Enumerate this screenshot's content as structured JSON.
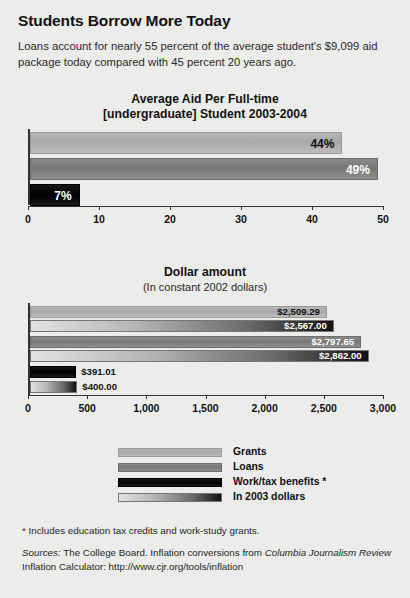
{
  "headline": "Students Borrow More Today",
  "deck": "Loans account for nearly 55 percent of the average student's $9,099 aid package today compared with 45 percent 20 years ago.",
  "chart_data": [
    {
      "type": "bar",
      "orientation": "horizontal",
      "title": "Average Aid Per Full-time\n[undergraduate] Student 2003-2004",
      "title_line1": "Average Aid Per Full-time",
      "title_line2": "[undergraduate] Student 2003-2004",
      "subtitle": "",
      "xlabel": "",
      "ylabel": "",
      "xlim": [
        0,
        50
      ],
      "ticks": [
        0,
        10,
        20,
        30,
        40,
        50
      ],
      "ticklabels": [
        "0",
        "10",
        "20",
        "30",
        "40",
        "50"
      ],
      "grid": false,
      "categories": [
        "Grants",
        "Loans",
        "Work/tax benefits *"
      ],
      "values": [
        44,
        49,
        7
      ],
      "data_labels": [
        "44%",
        "49%",
        "7%"
      ],
      "label_colors": [
        "#111111",
        "#ffffff",
        "#ffffff"
      ],
      "series_styles": [
        "grants",
        "loans",
        "work"
      ]
    },
    {
      "type": "bar",
      "orientation": "horizontal",
      "title": "Dollar amount",
      "subtitle": "(In constant 2002 dollars)",
      "xlabel": "",
      "ylabel": "",
      "xlim": [
        0,
        3000
      ],
      "ticks": [
        0,
        500,
        1000,
        1500,
        2000,
        2500,
        3000
      ],
      "ticklabels": [
        "0",
        "500",
        "1,000",
        "1,500",
        "2,000",
        "2,500",
        "3,000"
      ],
      "grid": false,
      "categories": [
        "Grants",
        "In 2003 dollars",
        "Loans",
        "In 2003 dollars",
        "Work/tax benefits *",
        "In 2003 dollars"
      ],
      "values": [
        2509.29,
        2567.0,
        2797.65,
        2862.0,
        391.01,
        400.0
      ],
      "data_labels": [
        "$2,509.29",
        "$2,567.00",
        "$2,797.65",
        "$2,862.00",
        "$391.01",
        "$400.00"
      ],
      "label_colors": [
        "#111111",
        "#ffffff",
        "#ffffff",
        "#ffffff",
        "#111111",
        "#111111"
      ],
      "label_inside": [
        true,
        true,
        true,
        true,
        false,
        false
      ],
      "series_styles": [
        "grants",
        "2003",
        "loans",
        "2003",
        "work",
        "2003"
      ]
    }
  ],
  "legend": {
    "items": [
      {
        "label": "Grants",
        "style": "grants"
      },
      {
        "label": "Loans",
        "style": "loans"
      },
      {
        "label": "Work/tax benefits *",
        "style": "work"
      },
      {
        "label": "In 2003 dollars",
        "style": "2003"
      }
    ]
  },
  "footnotes": {
    "asterisk": "* Includes education tax credits and work-study grants.",
    "sources_label": "Sources:",
    "sources_part1": " The College Board. Inflation conversions from ",
    "sources_em1": "Columbia Journalism",
    "sources_em2": "Review",
    "sources_part2": " Inflation Calculator: http://www.cjr.org/tools/inflation"
  },
  "colors": {
    "background": "#ececea",
    "axis": "#333333",
    "grants": "#aeaeae",
    "loans": "#7f7f7f",
    "work": "#000000",
    "dollars2003_start": "#e2e2e2",
    "dollars2003_end": "#111111"
  }
}
